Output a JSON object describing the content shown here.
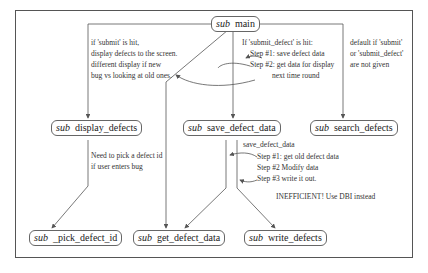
{
  "nodes": {
    "main": {
      "kw": "sub",
      "label": "main"
    },
    "display_defects": {
      "kw": "sub",
      "label": "display_defects"
    },
    "save_defect_data": {
      "kw": "sub",
      "label": "save_defect_data"
    },
    "search_defects": {
      "kw": "sub",
      "label": "search_defects"
    },
    "pick_defect_id": {
      "kw": "sub",
      "label": "_pick_defect_id"
    },
    "get_defect_data": {
      "kw": "sub",
      "label": "get_defect_data"
    },
    "write_defects": {
      "kw": "sub",
      "label": "write_defects"
    }
  },
  "notes": {
    "submit": [
      "if 'submit' is hit,",
      "display defects to the screen.",
      "different display if new",
      "bug vs looking at old ones."
    ],
    "submit_defect": [
      "If 'submit_defect' is hit:",
      "Step #1: save defect data",
      "Step #2: get data for display",
      "next time round"
    ],
    "default": [
      "default if 'submit'",
      "or 'submit_defect'",
      "are not given"
    ],
    "pick": [
      "Need to pick a defect id",
      "if user enters bug"
    ],
    "save_title": "save_defect_data",
    "save_steps": [
      "Step #1: get old defect data",
      "Step #2 Modify data",
      "Step #3 write it out."
    ],
    "inefficient": "INEFFICIENT! Use DBI instead"
  },
  "colors": {
    "line": "#555555",
    "text": "#222222",
    "border": "#666666"
  }
}
